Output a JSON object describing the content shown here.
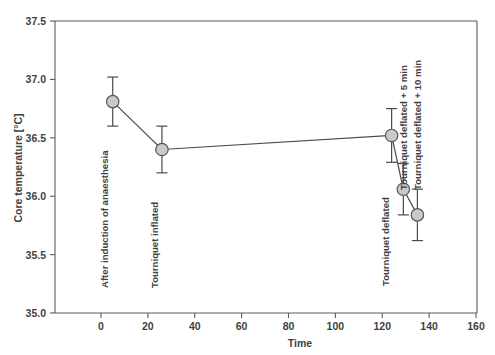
{
  "chart_data": {
    "type": "line",
    "title": "",
    "xlabel": "Time",
    "ylabel": "Core temperature [°C]",
    "xlim": [
      -10,
      160
    ],
    "ylim": [
      35.0,
      37.5
    ],
    "xticks": [
      0,
      20,
      40,
      60,
      80,
      100,
      120,
      140,
      160
    ],
    "xticklabels": [
      "0",
      "20",
      "40",
      "60",
      "80",
      "100",
      "120",
      "140",
      "160"
    ],
    "yticks": [
      35.0,
      35.5,
      36.0,
      36.5,
      37.0,
      37.5
    ],
    "yticklabels": [
      "35.0",
      "35.5",
      "36.0",
      "36.5",
      "37.0",
      "37.5"
    ],
    "grid": false,
    "legend": null,
    "marker": "circle",
    "marker_facecolor": "#c9c9c9",
    "marker_edgecolor": "#555555",
    "line_color": "#4a4a4a",
    "errorbar_style": "symmetric-sd",
    "x": [
      5,
      26,
      124,
      129,
      135
    ],
    "values": [
      36.81,
      36.4,
      36.52,
      36.06,
      35.84
    ],
    "errors": [
      0.21,
      0.2,
      0.23,
      0.22,
      0.22
    ],
    "point_labels": [
      "After induction of anaesthesia",
      "Tourniquet inflated",
      "Tourniquet deflated",
      "Tourniquet deflated + 5 min",
      "Tourniquet deflated + 10 min"
    ]
  }
}
